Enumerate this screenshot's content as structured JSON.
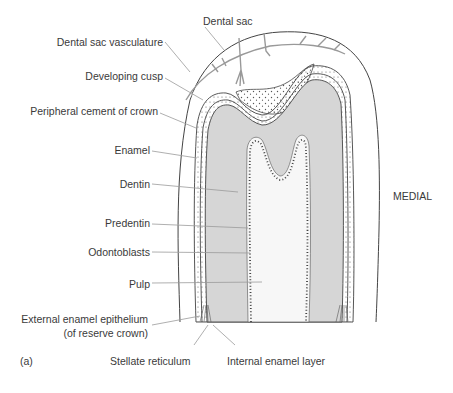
{
  "figure": {
    "panel_label": "(a)",
    "orientation_label": "MEDIAL",
    "colors": {
      "dentin_fill": "#d6d6d6",
      "pulp_fill": "#f6f6f6",
      "outline": "#444444",
      "leader_line": "#9a9a9a",
      "text": "#3a3a3a"
    }
  },
  "labels": {
    "dental_sac": "Dental sac",
    "dental_sac_vasculature": "Dental sac vasculature",
    "developing_cusp": "Developing cusp",
    "peripheral_cement": "Peripheral cement of crown",
    "enamel": "Enamel",
    "dentin": "Dentin",
    "predentin": "Predentin",
    "odontoblasts": "Odontoblasts",
    "pulp": "Pulp",
    "external_enamel_line1": "External enamel epithelium",
    "external_enamel_line2": "(of reserve crown)",
    "stellate_reticulum": "Stellate reticulum",
    "internal_enamel_layer": "Internal enamel layer"
  }
}
